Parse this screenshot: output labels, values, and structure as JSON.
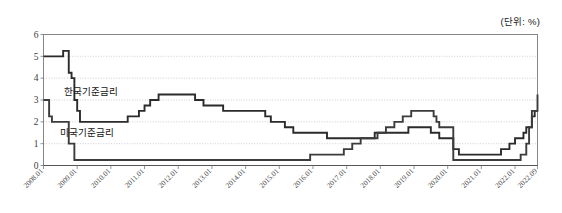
{
  "unit_note": "(단위: %)",
  "series_labels": {
    "korea": "한국기준금리",
    "us": "미국기준금리"
  },
  "chart_data": {
    "type": "line",
    "title": "",
    "subtitle": "",
    "xlabel": "",
    "ylabel": "",
    "unit": "(단위: %)",
    "grid": true,
    "legend_position": "inline-annotation",
    "ylim": [
      0,
      6
    ],
    "ytick_labels": [
      "0",
      "1",
      "2",
      "3",
      "4",
      "5",
      "6"
    ],
    "yticks": [
      0,
      1,
      2,
      3,
      4,
      5,
      6
    ],
    "xtick_labels": [
      "2008.01",
      "2009.01",
      "2010.01",
      "2011.01",
      "2012.01",
      "2013.01",
      "2014.01",
      "2015.01",
      "2016.01",
      "2017.01",
      "2018.01",
      "2019.01",
      "2020.01",
      "2021.01",
      "2022.01",
      "2022.09"
    ],
    "xlim": [
      "2008.01",
      "2022.09"
    ],
    "colors": {
      "korea": "#2b2b2b",
      "us": "#3c3c3c",
      "grid": "#b9b9cf",
      "axis": "#7a7a7a"
    },
    "series": [
      {
        "name": "한국기준금리",
        "x": [
          "2008.01",
          "2008.02",
          "2008.03",
          "2008.04",
          "2008.05",
          "2008.06",
          "2008.07",
          "2008.08",
          "2008.09",
          "2008.10",
          "2008.11",
          "2008.12",
          "2009.01",
          "2009.02",
          "2009.03",
          "2009.06",
          "2009.12",
          "2010.06",
          "2010.07",
          "2010.11",
          "2011.01",
          "2011.03",
          "2011.06",
          "2012.01",
          "2012.07",
          "2012.10",
          "2013.05",
          "2014.08",
          "2014.10",
          "2015.03",
          "2015.06",
          "2016.06",
          "2017.11",
          "2018.11",
          "2019.07",
          "2019.10",
          "2020.03",
          "2020.05",
          "2021.08",
          "2021.11",
          "2022.01",
          "2022.04",
          "2022.05",
          "2022.07",
          "2022.08",
          "2022.09"
        ],
        "values": [
          5.0,
          5.0,
          5.0,
          5.0,
          5.0,
          5.0,
          5.0,
          5.25,
          5.25,
          4.25,
          4.0,
          3.0,
          2.5,
          2.0,
          2.0,
          2.0,
          2.0,
          2.0,
          2.25,
          2.5,
          2.75,
          3.0,
          3.25,
          3.25,
          3.0,
          2.75,
          2.5,
          2.25,
          2.0,
          1.75,
          1.5,
          1.25,
          1.5,
          1.75,
          1.5,
          1.25,
          0.75,
          0.5,
          0.75,
          1.0,
          1.25,
          1.5,
          1.75,
          2.25,
          2.5,
          2.5
        ]
      },
      {
        "name": "미국기준금리",
        "x": [
          "2008.01",
          "2008.02",
          "2008.03",
          "2008.04",
          "2008.09",
          "2008.10",
          "2008.11",
          "2008.12",
          "2009.01",
          "2015.12",
          "2016.12",
          "2017.03",
          "2017.06",
          "2017.12",
          "2018.03",
          "2018.06",
          "2018.09",
          "2018.12",
          "2019.08",
          "2019.09",
          "2019.10",
          "2020.03",
          "2020.04",
          "2021.12",
          "2022.03",
          "2022.05",
          "2022.06",
          "2022.07",
          "2022.09"
        ],
        "values": [
          3.0,
          3.0,
          2.25,
          2.0,
          2.0,
          1.0,
          1.0,
          0.25,
          0.25,
          0.5,
          0.75,
          1.0,
          1.25,
          1.5,
          1.75,
          2.0,
          2.25,
          2.5,
          2.25,
          2.0,
          1.75,
          0.25,
          0.25,
          0.25,
          0.5,
          1.0,
          1.75,
          2.5,
          3.25
        ]
      }
    ],
    "notes": [
      "한국기준금리 peaks at 5.25 in 2008.08 and falls to 2.0 by 2009.02",
      "미국기준금리 falls to 0.25 by 2008.12 and stays near zero until 2015.12",
      "Both rates collapse to near zero in 2020.03 and rise sharply through 2022"
    ]
  }
}
